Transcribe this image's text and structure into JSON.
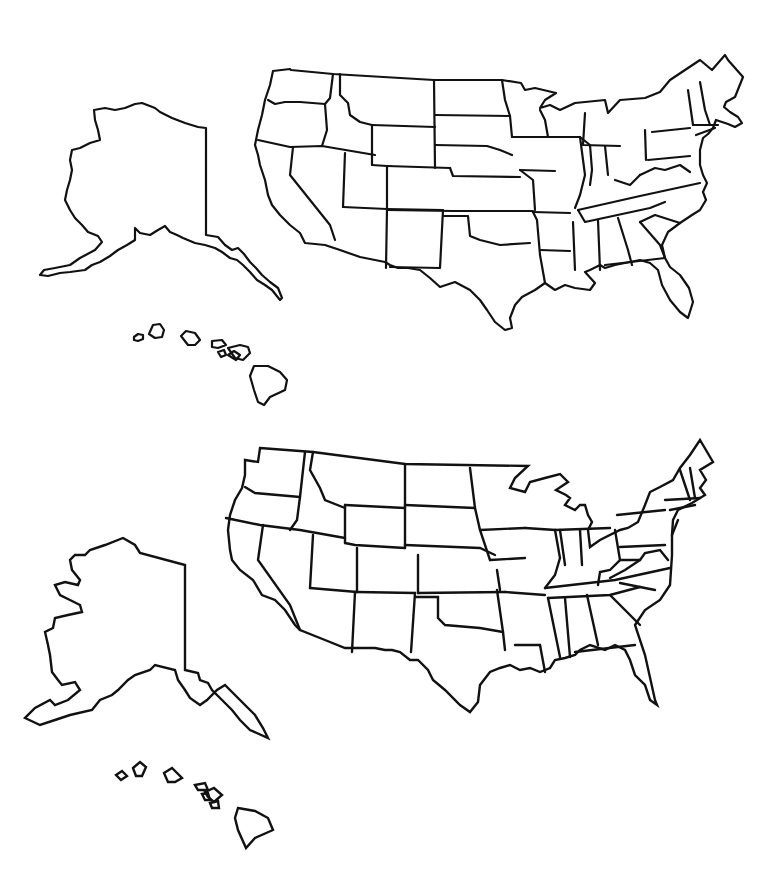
{
  "page": {
    "background": "#ffffff",
    "stroke_color": "#111111"
  },
  "maps": [
    {
      "id": "detailed",
      "style": "detailed natural coastline outline",
      "regions": [
        "contiguous-us",
        "alaska",
        "hawaii"
      ],
      "labels": []
    },
    {
      "id": "simplified",
      "style": "simplified angular outline",
      "regions": [
        "contiguous-us",
        "alaska",
        "hawaii"
      ],
      "labels": []
    }
  ]
}
